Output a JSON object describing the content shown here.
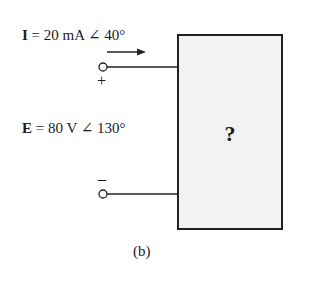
{
  "current_label": {
    "symbol": "I",
    "equals": "=",
    "value": "20 mA ∠ 40°"
  },
  "voltage_label": {
    "symbol": "E",
    "equals": "=",
    "value": "80 V ∠ 130°"
  },
  "plus_sign": "+",
  "minus_sign": "–",
  "box_label": "?",
  "caption": "(b)"
}
